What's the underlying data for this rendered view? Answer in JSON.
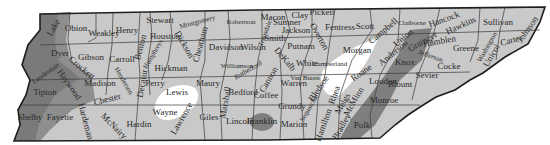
{
  "map": {
    "title": "Tennessee Counties",
    "colors": {
      "base": "#c9c9c9",
      "dark": "#7a7a7a",
      "medium": "#a3a3a3",
      "white": "#ffffff",
      "border": "#1e1e1e"
    },
    "counties": [
      {
        "name": "Obion",
        "x": 76,
        "y": 31,
        "rot": 0
      },
      {
        "name": "Weakley",
        "x": 104,
        "y": 36,
        "rot": 0
      },
      {
        "name": "Henry",
        "x": 127,
        "y": 33,
        "rot": 0
      },
      {
        "name": "Stewart",
        "x": 160,
        "y": 23,
        "rot": 0
      },
      {
        "name": "Montgomery",
        "x": 198,
        "y": 24,
        "rot": -15
      },
      {
        "name": "Robertson",
        "x": 241,
        "y": 24,
        "rot": 0
      },
      {
        "name": "Sumner",
        "x": 287,
        "y": 25,
        "rot": 0
      },
      {
        "name": "Macon",
        "x": 273,
        "y": 20,
        "rot": 0
      },
      {
        "name": "Clay",
        "x": 300,
        "y": 18,
        "rot": 0
      },
      {
        "name": "Pickett",
        "x": 322,
        "y": 15,
        "rot": 0
      },
      {
        "name": "Fentress",
        "x": 340,
        "y": 30,
        "rot": 0
      },
      {
        "name": "Scott",
        "x": 365,
        "y": 29,
        "rot": 0
      },
      {
        "name": "Campbell",
        "x": 385,
        "y": 33,
        "rot": -40
      },
      {
        "name": "Claiborne",
        "x": 412,
        "y": 25,
        "rot": 0
      },
      {
        "name": "Hancock",
        "x": 445,
        "y": 22,
        "rot": -20
      },
      {
        "name": "Hawkins",
        "x": 462,
        "y": 28,
        "rot": -25
      },
      {
        "name": "Sullivan",
        "x": 498,
        "y": 25,
        "rot": 0
      },
      {
        "name": "Johnson",
        "x": 530,
        "y": 31,
        "rot": -55
      },
      {
        "name": "Carter",
        "x": 512,
        "y": 43,
        "rot": -15
      },
      {
        "name": "Washington",
        "x": 489,
        "y": 48,
        "rot": -60
      },
      {
        "name": "Unicoi",
        "x": 494,
        "y": 57,
        "rot": -60
      },
      {
        "name": "Greene",
        "x": 466,
        "y": 51,
        "rot": 0
      },
      {
        "name": "Grainger",
        "x": 424,
        "y": 44,
        "rot": -30
      },
      {
        "name": "Hamblen",
        "x": 440,
        "y": 44,
        "rot": -10
      },
      {
        "name": "Jefferson",
        "x": 430,
        "y": 58,
        "rot": 20
      },
      {
        "name": "Cocke",
        "x": 449,
        "y": 69,
        "rot": 0
      },
      {
        "name": "Union",
        "x": 405,
        "y": 40,
        "rot": -40
      },
      {
        "name": "Anderson",
        "x": 395,
        "y": 55,
        "rot": -40
      },
      {
        "name": "Knox",
        "x": 405,
        "y": 65,
        "rot": 0
      },
      {
        "name": "Sevier",
        "x": 427,
        "y": 78,
        "rot": 0
      },
      {
        "name": "Blount",
        "x": 400,
        "y": 87,
        "rot": 0
      },
      {
        "name": "Morgan",
        "x": 357,
        "y": 53,
        "rot": 0
      },
      {
        "name": "Roane",
        "x": 363,
        "y": 75,
        "rot": -35
      },
      {
        "name": "Loudon",
        "x": 383,
        "y": 84,
        "rot": 0
      },
      {
        "name": "Monroe",
        "x": 384,
        "y": 103,
        "rot": 0
      },
      {
        "name": "Cumberland",
        "x": 330,
        "y": 66,
        "rot": 0
      },
      {
        "name": "Overton",
        "x": 317,
        "y": 38,
        "rot": 60
      },
      {
        "name": "Jackson",
        "x": 296,
        "y": 33,
        "rot": 0
      },
      {
        "name": "Putnam",
        "x": 301,
        "y": 49,
        "rot": 0
      },
      {
        "name": "White",
        "x": 307,
        "y": 66,
        "rot": 0
      },
      {
        "name": "Smith",
        "x": 275,
        "y": 41,
        "rot": 0
      },
      {
        "name": "DeKalb",
        "x": 283,
        "y": 61,
        "rot": 50
      },
      {
        "name": "Wilson",
        "x": 253,
        "y": 50,
        "rot": 0
      },
      {
        "name": "Trousdale",
        "x": 267,
        "y": 34,
        "rot": -70
      },
      {
        "name": "Davidson",
        "x": 226,
        "y": 50,
        "rot": 0
      },
      {
        "name": "Cheatham",
        "x": 203,
        "y": 45,
        "rot": -75
      },
      {
        "name": "Dickson",
        "x": 182,
        "y": 46,
        "rot": 60
      },
      {
        "name": "Houston",
        "x": 165,
        "y": 39,
        "rot": 0
      },
      {
        "name": "Humphreys",
        "x": 155,
        "y": 55,
        "rot": -60
      },
      {
        "name": "Benton",
        "x": 143,
        "y": 48,
        "rot": -75
      },
      {
        "name": "Carroll",
        "x": 122,
        "y": 62,
        "rot": 0
      },
      {
        "name": "Gibson",
        "x": 91,
        "y": 60,
        "rot": 0
      },
      {
        "name": "Dyer",
        "x": 60,
        "y": 56,
        "rot": 0
      },
      {
        "name": "Lake",
        "x": 56,
        "y": 29,
        "rot": -60
      },
      {
        "name": "Crockett",
        "x": 80,
        "y": 70,
        "rot": 40
      },
      {
        "name": "Lauderdale",
        "x": 47,
        "y": 75,
        "rot": -35
      },
      {
        "name": "Haywood",
        "x": 67,
        "y": 86,
        "rot": 55
      },
      {
        "name": "Tipton",
        "x": 45,
        "y": 95,
        "rot": 0
      },
      {
        "name": "Madison",
        "x": 100,
        "y": 86,
        "rot": 0
      },
      {
        "name": "Shelby",
        "x": 30,
        "y": 120,
        "rot": 0
      },
      {
        "name": "Fayette",
        "x": 60,
        "y": 120,
        "rot": 0
      },
      {
        "name": "Hardeman",
        "x": 83,
        "y": 122,
        "rot": 75
      },
      {
        "name": "Chester",
        "x": 108,
        "y": 102,
        "rot": -15
      },
      {
        "name": "Henderson",
        "x": 122,
        "y": 82,
        "rot": 60
      },
      {
        "name": "McNairy",
        "x": 112,
        "y": 128,
        "rot": 45
      },
      {
        "name": "Hardin",
        "x": 139,
        "y": 127,
        "rot": 0
      },
      {
        "name": "Decatur",
        "x": 145,
        "y": 84,
        "rot": -80
      },
      {
        "name": "Perry",
        "x": 155,
        "y": 86,
        "rot": 0
      },
      {
        "name": "Lewis",
        "x": 177,
        "y": 95,
        "rot": 0
      },
      {
        "name": "Hickman",
        "x": 171,
        "y": 71,
        "rot": 0
      },
      {
        "name": "Wayne",
        "x": 165,
        "y": 115,
        "rot": 0
      },
      {
        "name": "Lawrence",
        "x": 184,
        "y": 120,
        "rot": -60
      },
      {
        "name": "Giles",
        "x": 209,
        "y": 120,
        "rot": 0
      },
      {
        "name": "Maury",
        "x": 208,
        "y": 86,
        "rot": 0
      },
      {
        "name": "Williamson",
        "x": 237,
        "y": 68,
        "rot": 0
      },
      {
        "name": "Marshall",
        "x": 228,
        "y": 103,
        "rot": -80
      },
      {
        "name": "Rutherford",
        "x": 249,
        "y": 72,
        "rot": -30
      },
      {
        "name": "Cannon",
        "x": 271,
        "y": 81,
        "rot": -60
      },
      {
        "name": "Bedford",
        "x": 243,
        "y": 95,
        "rot": 0
      },
      {
        "name": "Lincoln",
        "x": 240,
        "y": 124,
        "rot": 0
      },
      {
        "name": "Franklin",
        "x": 262,
        "y": 124,
        "rot": 0
      },
      {
        "name": "Coffee",
        "x": 266,
        "y": 98,
        "rot": 0
      },
      {
        "name": "Warren",
        "x": 294,
        "y": 86,
        "rot": 0
      },
      {
        "name": "Van Buren",
        "x": 305,
        "y": 80,
        "rot": 0
      },
      {
        "name": "Grundy",
        "x": 292,
        "y": 109,
        "rot": 0
      },
      {
        "name": "Sequatchie",
        "x": 311,
        "y": 109,
        "rot": -60
      },
      {
        "name": "Marion",
        "x": 294,
        "y": 127,
        "rot": 0
      },
      {
        "name": "Bledsoe",
        "x": 321,
        "y": 90,
        "rot": -55
      },
      {
        "name": "Rhea",
        "x": 337,
        "y": 96,
        "rot": -70
      },
      {
        "name": "Meigs",
        "x": 345,
        "y": 105,
        "rot": -60
      },
      {
        "name": "Hamilton",
        "x": 326,
        "y": 126,
        "rot": -70
      },
      {
        "name": "McMinn",
        "x": 356,
        "y": 103,
        "rot": -60
      },
      {
        "name": "Bradley",
        "x": 344,
        "y": 128,
        "rot": -60
      },
      {
        "name": "Polk",
        "x": 362,
        "y": 128,
        "rot": 0
      }
    ]
  }
}
